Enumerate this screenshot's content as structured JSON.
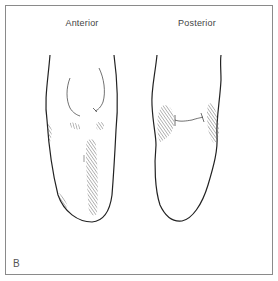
{
  "figure": {
    "panel_letter": "B",
    "views": [
      {
        "id": "anterior",
        "label": "Anterior"
      },
      {
        "id": "posterior",
        "label": "Posterior"
      }
    ],
    "colors": {
      "line": "#222222",
      "hatch": "#555555",
      "frame": "#8a8a8a"
    }
  }
}
